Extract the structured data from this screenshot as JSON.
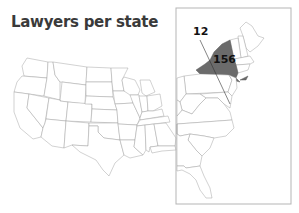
{
  "title": "Lawyers per state",
  "map": {
    "region": "Contiguous United States",
    "inset": "Northeast / East Coast",
    "highlight_color": "#6b6b6b",
    "border_color": "#9a9a9a",
    "labels": [
      {
        "state": "New York",
        "value": "156"
      },
      {
        "state": "Delaware / Maryland (via leader line)",
        "value": "12"
      }
    ]
  }
}
